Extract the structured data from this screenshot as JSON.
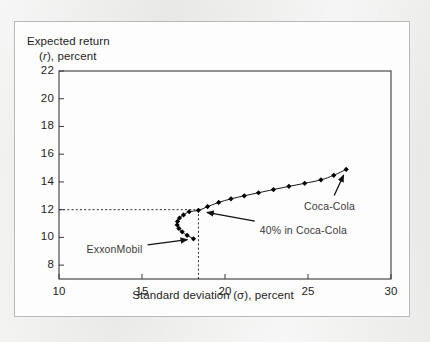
{
  "figure": {
    "background_color": "#e9e9e7",
    "card_color": "#fdfdfd",
    "border_color": "#b9b9b7"
  },
  "axis_labels": {
    "y_line1": "Expected return",
    "y_line2_prefix": "(",
    "y_line2_symbol": "r",
    "y_line2_suffix": "), percent",
    "x": "Standard deviation (σ), percent"
  },
  "chart_data": {
    "type": "line",
    "title": "",
    "subtitle": "",
    "xlabel": "Standard deviation (σ), percent",
    "ylabel": "Expected return (r), percent",
    "xlim": [
      10,
      30
    ],
    "ylim": [
      7,
      22
    ],
    "xticks": [
      10,
      15,
      20,
      25,
      30
    ],
    "yticks": [
      8,
      10,
      12,
      14,
      16,
      18,
      20,
      22
    ],
    "xtick_labels": [
      "10",
      "15",
      "20",
      "25",
      "30"
    ],
    "ytick_labels": [
      "8",
      "10",
      "12",
      "14",
      "16",
      "18",
      "20",
      "22"
    ],
    "grid": false,
    "legend_position": "none",
    "marker": "diamond",
    "marker_color": "#000000",
    "line_color": "#1a1a1a",
    "series": [
      {
        "name": "Efficient frontier (ExxonMobil / Coca-Cola portfolios)",
        "x": [
          18.1,
          17.72,
          17.42,
          17.22,
          17.12,
          17.14,
          17.26,
          17.5,
          17.84,
          18.4,
          18.95,
          19.62,
          20.36,
          21.16,
          22.02,
          22.92,
          23.85,
          24.8,
          25.78,
          26.55,
          27.3
        ],
        "y": [
          9.9,
          10.15,
          10.4,
          10.65,
          10.9,
          11.15,
          11.4,
          11.62,
          11.85,
          11.95,
          12.22,
          12.52,
          12.78,
          13.0,
          13.22,
          13.45,
          13.68,
          13.9,
          14.15,
          14.48,
          14.9
        ]
      }
    ],
    "reference_lines": [
      {
        "name": "horizontal-12-percent",
        "orientation": "horizontal",
        "value": 12,
        "style": "dashed",
        "from_x": 10,
        "to_x": 18.4
      },
      {
        "name": "vertical-minimum-point",
        "orientation": "vertical",
        "value": 18.4,
        "style": "dashed",
        "from_y": 7,
        "to_y": 12
      }
    ],
    "annotations": [
      {
        "id": "exxonmobil",
        "label": "ExxonMobil",
        "point_x": 18.1,
        "point_y": 9.9,
        "text_x": 13.35,
        "text_y": 9.15
      },
      {
        "id": "forty-percent-coca-cola",
        "label": "40% in Coca-Cola",
        "point_x": 18.55,
        "point_y": 11.88,
        "text_x": 22.1,
        "text_y": 10.55
      },
      {
        "id": "coca-cola",
        "label": "Coca-Cola",
        "point_x": 27.3,
        "point_y": 14.9,
        "text_x": 26.3,
        "text_y": 12.3
      }
    ]
  }
}
